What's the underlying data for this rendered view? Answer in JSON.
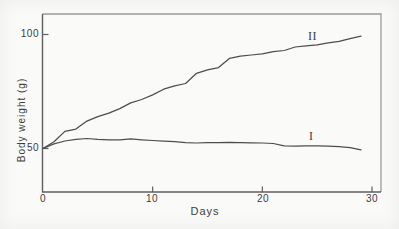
{
  "figure": {
    "background": "#fafaf8",
    "curve_color": "#4d4d4d",
    "axis_color": "#5f5f5f",
    "frame_light_color": "#9b9b9b",
    "text_color": "#3d3d3d"
  },
  "chart_data": {
    "type": "line",
    "title": "",
    "xlabel": "Days",
    "ylabel": "Body weight (g)",
    "xlim": [
      0,
      31
    ],
    "ylim": [
      30,
      109
    ],
    "grid": false,
    "legend_position": "inline-labels-right-of-curves",
    "x_ticks": [
      0,
      10,
      20,
      30
    ],
    "x_tick_labels": [
      "0",
      "10",
      "20",
      "30"
    ],
    "y_ticks": [
      50,
      100
    ],
    "y_tick_labels": [
      "50",
      "100"
    ],
    "x": [
      0,
      1,
      2,
      3,
      4,
      5,
      6,
      7,
      8,
      9,
      10,
      11,
      12,
      13,
      14,
      15,
      16,
      17,
      18,
      19,
      20,
      21,
      22,
      23,
      24,
      25,
      26,
      27,
      28,
      29
    ],
    "series": [
      {
        "name": "II",
        "values": [
          50,
          53,
          57.5,
          58.5,
          62,
          64,
          65.5,
          67.5,
          70,
          71.5,
          73.5,
          76,
          77.5,
          78.5,
          83,
          84.5,
          85.5,
          89.5,
          90.5,
          91,
          91.5,
          92.5,
          93,
          94.5,
          95,
          95.5,
          96.3,
          97,
          98.2,
          99.3
        ]
      },
      {
        "name": "I",
        "values": [
          50,
          52,
          53.3,
          54,
          54.4,
          54,
          53.8,
          53.8,
          54.2,
          53.8,
          53.5,
          53.2,
          53,
          52.6,
          52.4,
          52.6,
          52.6,
          52.7,
          52.6,
          52.5,
          52.4,
          52.2,
          51.2,
          51,
          51.2,
          51.2,
          51,
          50.8,
          50.4,
          49.4
        ]
      }
    ]
  }
}
